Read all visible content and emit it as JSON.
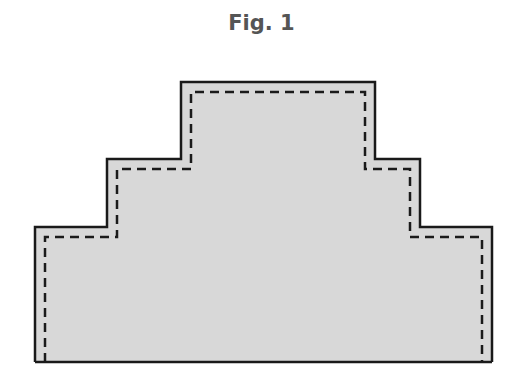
{
  "figure": {
    "title": "Fig. 1",
    "shape": "stepped-pyramid",
    "colors": {
      "fill": "#d8d8d8",
      "outline": "#1a1a1a",
      "dashed": "#1a1a1a",
      "title": "#555555"
    },
    "outline_points": "35,362 35,227 107,227 107,159 181,159 181,82 375,82 375,159 420,159 420,227 492,227 492,362",
    "dashed_points": "45,362 45,237 117,237 117,169 191,169 191,92 365,92 365,169 410,169 410,237 482,237 482,362"
  }
}
